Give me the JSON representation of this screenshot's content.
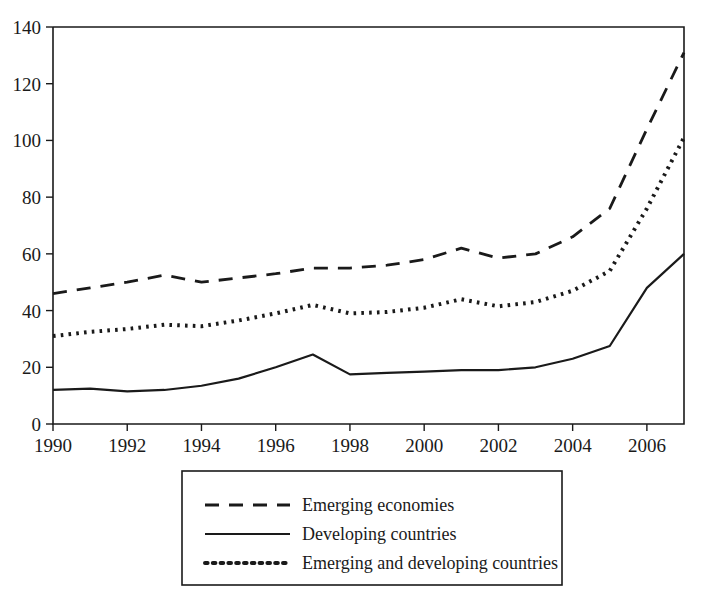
{
  "chart_data": {
    "type": "line",
    "title": "",
    "subtitle": "",
    "xlabel": "",
    "ylabel": "",
    "xlim": [
      1990,
      2007
    ],
    "ylim": [
      0,
      140
    ],
    "grid": false,
    "legend_position": "below-plot",
    "x": [
      1990,
      1991,
      1992,
      1993,
      1994,
      1995,
      1996,
      1997,
      1998,
      1999,
      2000,
      2001,
      2002,
      2003,
      2004,
      2005,
      2006,
      2007
    ],
    "x_tick_labels": [
      "1990",
      "1992",
      "1994",
      "1996",
      "1998",
      "2000",
      "2002",
      "2004",
      "2006"
    ],
    "x_ticks": [
      1990,
      1992,
      1994,
      1996,
      1998,
      2000,
      2002,
      2004,
      2006
    ],
    "y_tick_labels": [
      "0",
      "20",
      "40",
      "60",
      "80",
      "100",
      "120",
      "140"
    ],
    "y_ticks": [
      0,
      20,
      40,
      60,
      80,
      100,
      120,
      140
    ],
    "series": [
      {
        "name": "Emerging economies",
        "style": "dashed",
        "values": [
          46,
          48,
          50,
          52.5,
          50,
          51.5,
          53,
          55,
          55,
          56,
          58,
          62,
          58.5,
          60,
          66,
          76,
          104,
          131
        ]
      },
      {
        "name": "Developing countries",
        "style": "solid",
        "values": [
          12,
          12.5,
          11.5,
          12,
          13.5,
          16,
          20,
          24.5,
          17.5,
          18,
          18.5,
          19,
          19,
          20,
          23,
          27.5,
          48,
          60
        ]
      },
      {
        "name": "Emerging and developing countries",
        "style": "dotted",
        "values": [
          31,
          32.5,
          33.5,
          35,
          34.5,
          36.5,
          39,
          42,
          39,
          39.5,
          41,
          44,
          41.5,
          43,
          47,
          54,
          76,
          101
        ]
      }
    ],
    "colors": {
      "line": "#1a1a1a",
      "axis": "#1a1a1a",
      "background": "#ffffff"
    }
  },
  "legend": {
    "items": [
      {
        "label": "Emerging economies",
        "style": "dashed"
      },
      {
        "label": "Developing countries",
        "style": "solid"
      },
      {
        "label": "Emerging and developing countries",
        "style": "dotted"
      }
    ]
  }
}
